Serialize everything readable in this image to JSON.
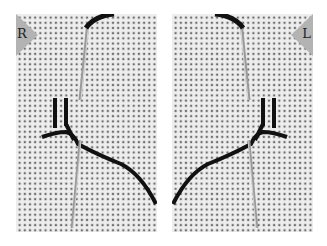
{
  "figure": {
    "panels": [
      {
        "side": "left",
        "label": "R"
      },
      {
        "side": "right",
        "label": "L"
      }
    ],
    "colors": {
      "fabric": "#eeeeee",
      "fabric_holes": "#666666",
      "thread": "#111111",
      "needle": "#a0a0a0",
      "label_tag": "#b3b3b3"
    }
  }
}
